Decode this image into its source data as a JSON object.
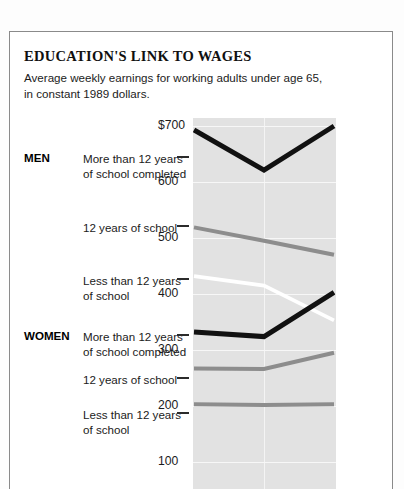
{
  "card": {
    "title": "EDUCATION'S LINK TO WAGES",
    "subtitle": "Average weekly earnings for working adults under age 65, in constant 1989 dollars."
  },
  "groups": [
    {
      "id": "men",
      "label": "MEN"
    },
    {
      "id": "women",
      "label": "WOMEN"
    }
  ],
  "series_labels": [
    {
      "id": "men-more",
      "line1": "More than 12 years",
      "line2": "of school completed"
    },
    {
      "id": "men-12",
      "line1": "12 years of school",
      "line2": ""
    },
    {
      "id": "men-less",
      "line1": "Less than 12 years",
      "line2": "of school"
    },
    {
      "id": "women-more",
      "line1": "More than 12 years",
      "line2": "of school completed"
    },
    {
      "id": "women-12",
      "line1": "12 years of school",
      "line2": ""
    },
    {
      "id": "women-less",
      "line1": "Less than 12 years",
      "line2": "of school"
    }
  ],
  "axis": {
    "ticks": [
      "$700",
      "600",
      "500",
      "400",
      "300",
      "200",
      "100"
    ],
    "tick_values": [
      700,
      600,
      500,
      400,
      300,
      200,
      100
    ]
  },
  "colors": {
    "plot_background": "#e2e2e2",
    "gridline": "#f7f7f7",
    "dark_line": "#111111",
    "mid_line": "#8d8d8d",
    "light_line": "#ffffff",
    "frame": "#8a8a8a",
    "text": "#1b1b1b"
  },
  "chart_data": {
    "type": "line",
    "title": "EDUCATION'S LINK TO WAGES",
    "subtitle": "Average weekly earnings for working adults under age 65, in constant 1989 dollars.",
    "xlabel": "",
    "ylabel": "Average weekly earnings (constant 1989 dollars)",
    "ylim": [
      60,
      700
    ],
    "x": [
      0,
      1,
      2
    ],
    "grid": true,
    "legend": "left-labels",
    "series": [
      {
        "name": "MEN — More than 12 years of school completed",
        "values": [
          693,
          621,
          700
        ],
        "style": "dark"
      },
      {
        "name": "MEN — 12 years of school",
        "values": [
          519,
          495,
          470
        ],
        "style": "mid"
      },
      {
        "name": "MEN — Less than 12 years of school",
        "values": [
          432,
          415,
          353
        ],
        "style": "light"
      },
      {
        "name": "WOMEN — More than 12 years of school completed",
        "values": [
          332,
          324,
          403
        ],
        "style": "dark"
      },
      {
        "name": "WOMEN — 12 years of school",
        "values": [
          267,
          266,
          295
        ],
        "style": "mid"
      },
      {
        "name": "WOMEN — Less than 12 years of school",
        "values": [
          203,
          202,
          203
        ],
        "style": "mid"
      }
    ]
  }
}
